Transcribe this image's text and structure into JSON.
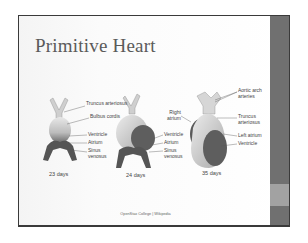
{
  "slide": {
    "title": "Primitive Heart",
    "credit": "OpenStax College | Wikipedia",
    "colors": {
      "stripe": "#707070",
      "stripe_accent": "#a2a2a2",
      "title": "#5a5a5a"
    }
  },
  "figure": {
    "stages": [
      {
        "day_label": "23 days",
        "labels": [
          "Truncus arteriosus",
          "Bulbus cordis",
          "Ventricle",
          "Atrium",
          "Sinus venosus"
        ]
      },
      {
        "day_label": "24 days",
        "labels": [
          "Ventricle",
          "Atrium",
          "Sinus venosus"
        ]
      },
      {
        "day_label": "35 days",
        "labels": [
          "Aortic arch arteries",
          "Right atrium",
          "Truncus arteriosus",
          "Left atrium",
          "Ventricle"
        ]
      }
    ]
  }
}
